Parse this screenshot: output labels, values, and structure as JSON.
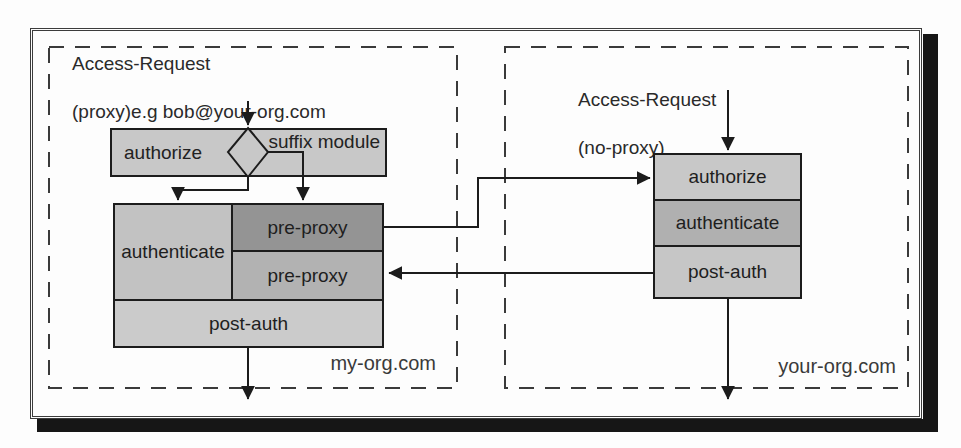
{
  "zones": {
    "left": {
      "org_label": "my-org.com",
      "request": {
        "line1": "Access-Request",
        "line2": "(proxy)e.g bob@your-org.com"
      },
      "authorize_bar": {
        "authorize_label": "authorize",
        "suffix_label": "suffix module"
      },
      "server_box": {
        "authenticate": "authenticate",
        "pre_proxy_out": "pre-proxy",
        "pre_proxy_in": "pre-proxy",
        "post_auth": "post-auth"
      }
    },
    "right": {
      "org_label": "your-org.com",
      "request": {
        "line1": "Access-Request",
        "line2": "(no-proxy)"
      },
      "server_box": {
        "authorize": "authorize",
        "authenticate": "authenticate",
        "post_auth": "post-auth"
      }
    }
  },
  "colors": {
    "cell_light": "#c8c8c8",
    "cell_medium": "#b2b2b2",
    "cell_dark": "#949494",
    "line": "#1c1c1c",
    "shadow": "#161616"
  }
}
